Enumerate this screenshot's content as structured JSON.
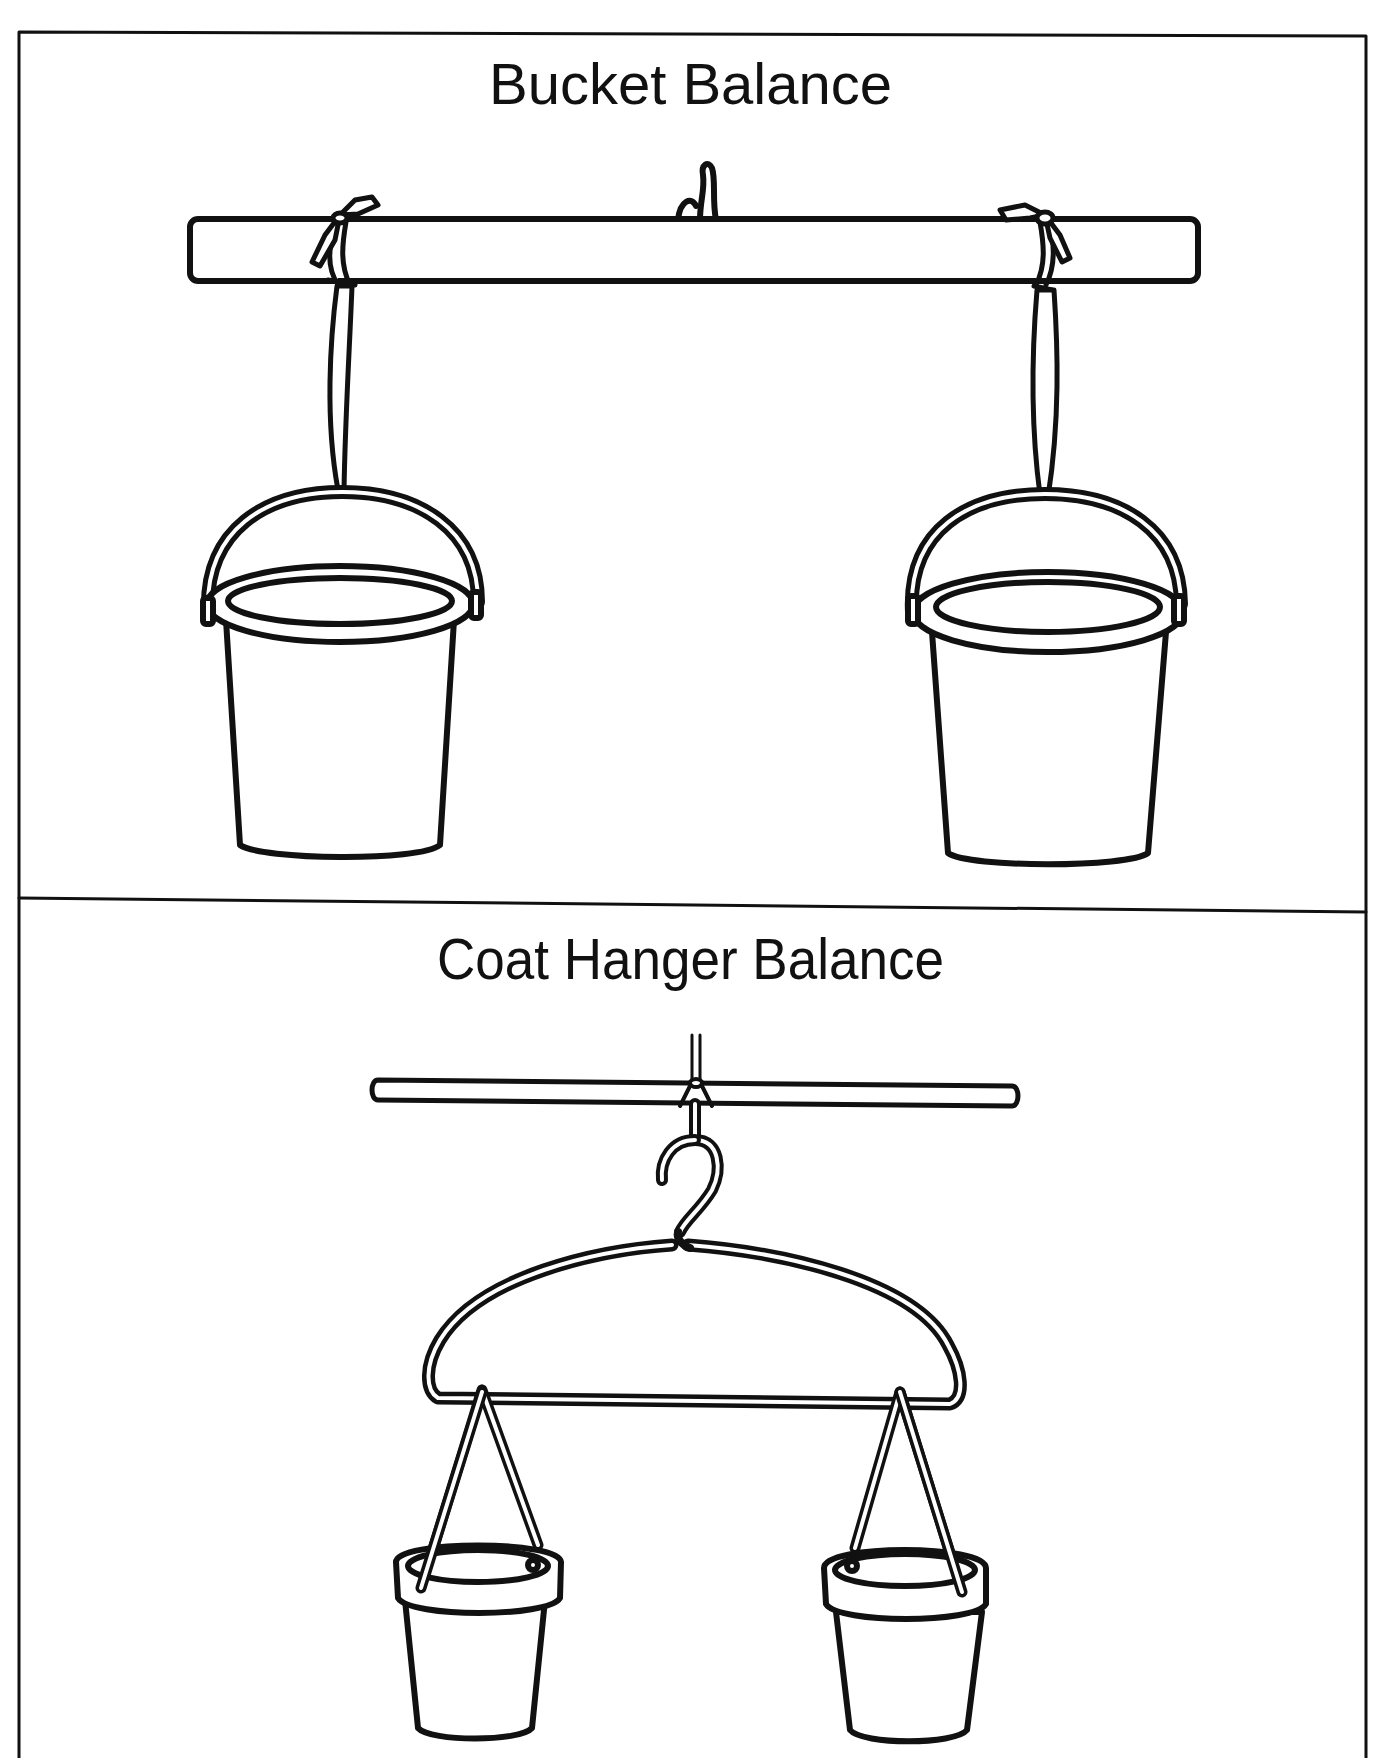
{
  "panels": [
    {
      "title": "Bucket Balance",
      "elements": [
        "horizontal-pole",
        "center-hook",
        "left-ribbon-tie",
        "right-ribbon-tie",
        "left-bucket",
        "right-bucket"
      ]
    },
    {
      "title": "Coat Hanger Balance",
      "elements": [
        "hanging-string",
        "thin-rod",
        "hanger-hook",
        "wire-coat-hanger",
        "left-small-bucket",
        "right-small-bucket"
      ]
    }
  ],
  "colors": {
    "ink": "#111111",
    "paper": "#ffffff"
  }
}
